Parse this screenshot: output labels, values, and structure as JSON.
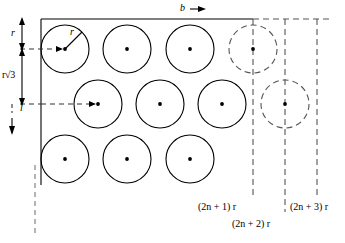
{
  "figure": {
    "labels": {
      "b": "b",
      "r_top": "r",
      "r_radius": "r",
      "r_sqrt3": "r√3",
      "l": "l",
      "col_2n1": "(2n + 1) r",
      "col_2n2": "(2n + 2) r",
      "col_2n3": "(2n + 3) r"
    },
    "colors": {
      "stroke": "#000000",
      "dashed": "#555555",
      "background": "#ffffff",
      "dot": "#000000"
    },
    "geometry": {
      "rect": {
        "x": 41,
        "y": 19,
        "width": 212,
        "height": 166
      },
      "circle_radius": 24,
      "row_spacing": 55,
      "solid_circles": [
        {
          "cx": 65,
          "cy": 49
        },
        {
          "cx": 127,
          "cy": 49
        },
        {
          "cx": 190,
          "cy": 49
        },
        {
          "cx": 98,
          "cy": 104
        },
        {
          "cx": 160,
          "cy": 104
        },
        {
          "cx": 222,
          "cy": 104
        },
        {
          "cx": 65,
          "cy": 159
        },
        {
          "cx": 127,
          "cy": 159
        },
        {
          "cx": 190,
          "cy": 159
        }
      ],
      "dashed_circles": [
        {
          "cx": 253,
          "cy": 49
        },
        {
          "cx": 285,
          "cy": 104
        }
      ],
      "dashed_vlines": [
        253,
        285,
        317
      ],
      "left_dashed_vline": 35
    }
  }
}
